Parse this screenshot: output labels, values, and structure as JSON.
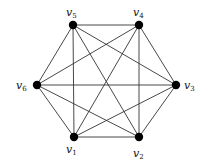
{
  "diagram": {
    "type": "complete-graph",
    "name": "K6",
    "colors": {
      "edge": "#333333",
      "node": "#000000",
      "label": "#111111"
    },
    "nodes": [
      {
        "id": "v1",
        "base": "v",
        "sub": "1",
        "x": 74,
        "y": 137,
        "lx": 66,
        "ly": 153
      },
      {
        "id": "v2",
        "base": "v",
        "sub": "2",
        "x": 139,
        "y": 137,
        "lx": 133,
        "ly": 157
      },
      {
        "id": "v3",
        "base": "v",
        "sub": "3",
        "x": 176,
        "y": 85,
        "lx": 184,
        "ly": 89
      },
      {
        "id": "v4",
        "base": "v",
        "sub": "4",
        "x": 139,
        "y": 25,
        "lx": 133,
        "ly": 16
      },
      {
        "id": "v5",
        "base": "v",
        "sub": "5",
        "x": 73,
        "y": 25,
        "lx": 66,
        "ly": 16
      },
      {
        "id": "v6",
        "base": "v",
        "sub": "6",
        "x": 37,
        "y": 85,
        "lx": 16,
        "ly": 89
      }
    ],
    "edges": [
      [
        "v1",
        "v2"
      ],
      [
        "v1",
        "v3"
      ],
      [
        "v1",
        "v4"
      ],
      [
        "v1",
        "v5"
      ],
      [
        "v1",
        "v6"
      ],
      [
        "v2",
        "v3"
      ],
      [
        "v2",
        "v4"
      ],
      [
        "v2",
        "v5"
      ],
      [
        "v2",
        "v6"
      ],
      [
        "v3",
        "v4"
      ],
      [
        "v3",
        "v5"
      ],
      [
        "v3",
        "v6"
      ],
      [
        "v4",
        "v5"
      ],
      [
        "v4",
        "v6"
      ],
      [
        "v5",
        "v6"
      ]
    ]
  }
}
